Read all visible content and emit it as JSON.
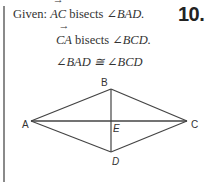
{
  "problem": {
    "number": "10.",
    "given_label": "Given:",
    "statements": [
      {
        "vector": "AC",
        "verb": "bisects",
        "angle": "∠BAD."
      },
      {
        "vector": "CA",
        "verb": "bisects",
        "angle": "∠BCD."
      },
      {
        "text": "∠BAD ≅ ∠BCD"
      }
    ],
    "arrow_glyph": "→"
  },
  "figure": {
    "stroke_color": "#444444",
    "points": {
      "A": {
        "x": 31,
        "y": 121,
        "label": "A"
      },
      "B": {
        "x": 111,
        "y": 89,
        "label": "B"
      },
      "C": {
        "x": 187,
        "y": 121,
        "label": "C"
      },
      "D": {
        "x": 111,
        "y": 152,
        "label": "D"
      },
      "E": {
        "x": 111,
        "y": 121,
        "label": "E"
      }
    },
    "segments": [
      "AB",
      "BC",
      "CD",
      "DA",
      "AC",
      "BD"
    ]
  }
}
